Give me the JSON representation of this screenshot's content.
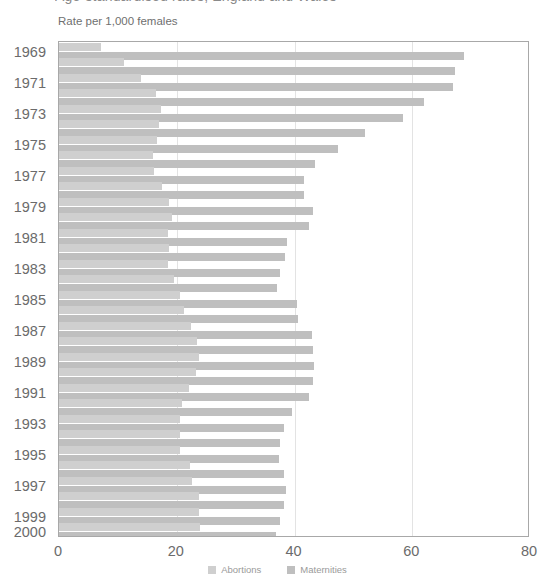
{
  "title_sliver": "Age-standardised rates, England and Wales",
  "axis_caption": "Rate per 1,000 females",
  "legend": {
    "position": "bottom-center",
    "items": [
      {
        "label": "Abortions",
        "color": "#cfcfcf",
        "icon": "square-swatch-icon"
      },
      {
        "label": "Maternities",
        "color": "#bfbfbf",
        "icon": "square-swatch-icon"
      }
    ]
  },
  "x_axis": {
    "ticks": [
      0,
      20,
      40,
      60,
      80
    ],
    "tick_labels": [
      "0",
      "20",
      "40",
      "60",
      "80"
    ],
    "min": 0,
    "max": 80,
    "gridlines": [
      20,
      40,
      60
    ]
  },
  "y_axis": {
    "visible_tick_labels": [
      "1969",
      "1971",
      "1973",
      "1975",
      "1977",
      "1979",
      "1981",
      "1983",
      "1985",
      "1987",
      "1989",
      "1991",
      "1993",
      "1995",
      "1997",
      "1999",
      "2000"
    ]
  },
  "chart_data": {
    "type": "bar",
    "orientation": "horizontal",
    "title": "Rate per 1,000 females",
    "xlabel": "Rate per 1,000 females",
    "ylabel": "",
    "xlim": [
      0,
      80
    ],
    "grid": true,
    "categories": [
      "1969",
      "1970",
      "1971",
      "1972",
      "1973",
      "1974",
      "1975",
      "1976",
      "1977",
      "1978",
      "1979",
      "1980",
      "1981",
      "1982",
      "1983",
      "1984",
      "1985",
      "1986",
      "1987",
      "1988",
      "1989",
      "1990",
      "1991",
      "1992",
      "1993",
      "1994",
      "1995",
      "1996",
      "1997",
      "1998",
      "1999",
      "2000"
    ],
    "series": [
      {
        "name": "Abortions",
        "color": "#cfcfcf",
        "values": [
          7.1,
          11.0,
          14.0,
          16.5,
          17.3,
          17.0,
          16.6,
          16.0,
          16.2,
          17.5,
          18.7,
          19.2,
          18.5,
          18.7,
          18.5,
          19.5,
          20.6,
          21.2,
          22.4,
          23.4,
          23.8,
          23.2,
          22.1,
          20.9,
          20.6,
          20.5,
          20.5,
          22.3,
          22.6,
          23.8,
          23.8,
          23.9
        ]
      },
      {
        "name": "Maternities",
        "color": "#bfbfbf",
        "values": [
          68.8,
          67.2,
          67.0,
          62.0,
          58.4,
          52.0,
          47.4,
          43.5,
          41.6,
          41.6,
          43.2,
          42.5,
          38.8,
          38.4,
          37.6,
          37.0,
          40.4,
          40.6,
          43.0,
          43.1,
          43.3,
          43.2,
          42.4,
          39.5,
          38.2,
          37.5,
          37.4,
          38.2,
          38.6,
          38.2,
          37.6,
          36.9
        ]
      }
    ]
  }
}
